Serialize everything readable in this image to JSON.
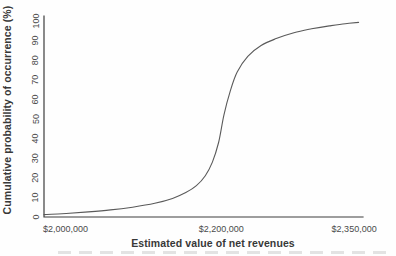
{
  "figure": {
    "background": "#fefefe"
  },
  "colors": {
    "axis": "#3d3d3d",
    "tick_text": "#4a4a4a",
    "title_text": "#383838",
    "curve": "#5a5a5a"
  },
  "chart_data": {
    "type": "line",
    "title": "",
    "xlabel": "Estimated value of net revenues",
    "ylabel": "Cumulative probability of occurrence (%)",
    "xlim": [
      2000000,
      2360000
    ],
    "ylim": [
      0,
      100
    ],
    "grid": false,
    "legend": false,
    "x_ticks": [
      {
        "value": 2000000,
        "label": "$2,000,000",
        "align": "start"
      },
      {
        "value": 2200000,
        "label": "$2,200,000",
        "align": "middle"
      },
      {
        "value": 2350000,
        "label": "$2,350,000",
        "align": "middle"
      }
    ],
    "y_ticks": [
      0,
      10,
      20,
      30,
      40,
      50,
      60,
      70,
      80,
      90,
      100
    ],
    "y_tick_rotation": -90,
    "series": [
      {
        "name": "cumulative probability of estimated net revenues",
        "color": "#5a5a5a",
        "points": [
          [
            2000000,
            1.2
          ],
          [
            2025000,
            1.8
          ],
          [
            2050000,
            2.6
          ],
          [
            2075000,
            3.6
          ],
          [
            2100000,
            5.0
          ],
          [
            2125000,
            7.0
          ],
          [
            2145000,
            9.5
          ],
          [
            2160000,
            12.5
          ],
          [
            2172000,
            16.0
          ],
          [
            2182000,
            21.0
          ],
          [
            2190000,
            28.0
          ],
          [
            2197000,
            38.0
          ],
          [
            2203000,
            52.0
          ],
          [
            2210000,
            64.0
          ],
          [
            2218000,
            74.0
          ],
          [
            2230000,
            82.0
          ],
          [
            2245000,
            87.5
          ],
          [
            2262000,
            91.0
          ],
          [
            2282000,
            94.0
          ],
          [
            2302000,
            96.0
          ],
          [
            2322000,
            97.5
          ],
          [
            2340000,
            98.6
          ],
          [
            2355000,
            99.3
          ]
        ]
      }
    ]
  }
}
